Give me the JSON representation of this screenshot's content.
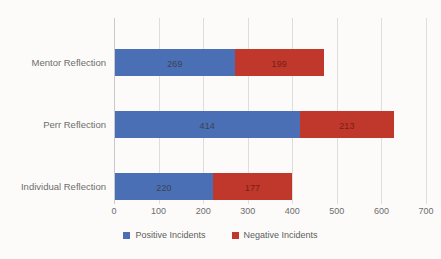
{
  "chart_data": {
    "type": "bar",
    "orientation": "horizontal",
    "stacked": true,
    "title": "",
    "xlabel": "",
    "ylabel": "",
    "xlim": [
      0,
      700
    ],
    "xticks": [
      "0",
      "100",
      "200",
      "300",
      "400",
      "500",
      "600",
      "700"
    ],
    "grid": true,
    "legend_position": "bottom",
    "categories": [
      "Mentor Reflection",
      "Perr Reflection",
      "Individual Reflection"
    ],
    "series": [
      {
        "name": "Positive Incidents",
        "color": "#4A6FB5",
        "values": [
          269,
          414,
          220
        ]
      },
      {
        "name": "Negative Incidents",
        "color": "#C0372B",
        "values": [
          199,
          213,
          177
        ]
      }
    ],
    "totals": [
      468,
      627,
      397
    ]
  },
  "colors": {
    "positive": "#4A6FB5",
    "negative": "#C0372B",
    "gridline": "#dedede",
    "axis_text": "#6d6d6d",
    "background": "#fcfbf9"
  },
  "legend": {
    "items": [
      {
        "label": "Positive Incidents",
        "color": "#4A6FB5"
      },
      {
        "label": "Negative Incidents",
        "color": "#C0372B"
      }
    ]
  }
}
